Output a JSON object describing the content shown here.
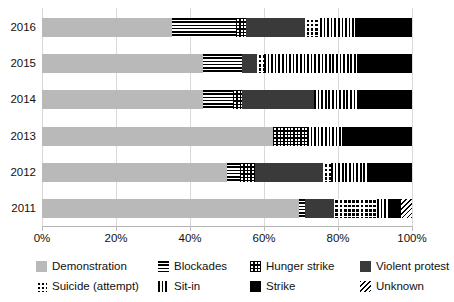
{
  "chart_data": {
    "type": "bar",
    "orientation": "horizontal",
    "stacked": true,
    "normalized": true,
    "title": "",
    "xlabel": "",
    "ylabel": "",
    "xlim": [
      0,
      100
    ],
    "xtick_labels": [
      "0%",
      "20%",
      "40%",
      "60%",
      "80%",
      "100%"
    ],
    "xticks": [
      0,
      20,
      40,
      60,
      80,
      100
    ],
    "grid": true,
    "legend_position": "bottom",
    "categories": [
      "2016",
      "2015",
      "2014",
      "2013",
      "2012",
      "2011"
    ],
    "series": [
      {
        "name": "Demonstration",
        "pattern": "solid-light-gray",
        "color": "#b9b9b9",
        "values": [
          35.0,
          43.5,
          43.5,
          62.5,
          50.0,
          69.5
        ]
      },
      {
        "name": "Blockades",
        "pattern": "horizontal-lines",
        "color": "#000000",
        "values": [
          17.5,
          10.5,
          8.0,
          0.0,
          3.5,
          1.5
        ]
      },
      {
        "name": "Hunger strike",
        "pattern": "cross-grid",
        "color": "#000000",
        "values": [
          2.5,
          0.0,
          2.5,
          9.0,
          4.0,
          0.0
        ]
      },
      {
        "name": "Violent protest",
        "pattern": "solid-dark-gray",
        "color": "#3a3a3a",
        "values": [
          16.0,
          4.0,
          19.5,
          0.0,
          18.5,
          8.0
        ]
      },
      {
        "name": "Suicide (attempt)",
        "pattern": "dotted-grid",
        "color": "#000000",
        "values": [
          4.0,
          2.0,
          0.0,
          0.0,
          2.0,
          11.5
        ]
      },
      {
        "name": "Sit-in",
        "pattern": "vertical-lines",
        "color": "#000000",
        "values": [
          9.5,
          25.0,
          12.0,
          9.5,
          10.5,
          3.0
        ]
      },
      {
        "name": "Strike",
        "pattern": "solid-black",
        "color": "#000000",
        "values": [
          15.5,
          15.0,
          14.5,
          19.0,
          11.5,
          3.5
        ]
      },
      {
        "name": "Unknown",
        "pattern": "diagonal-hatch",
        "color": "#000000",
        "values": [
          0.0,
          0.0,
          0.0,
          0.0,
          0.0,
          3.0
        ]
      }
    ]
  },
  "legend": {
    "items": [
      {
        "label": "Demonstration",
        "swatch": "solid-light-gray"
      },
      {
        "label": "Blockades",
        "swatch": "horizontal-lines"
      },
      {
        "label": "Hunger strike",
        "swatch": "cross-grid"
      },
      {
        "label": "Violent protest",
        "swatch": "solid-dark-gray"
      },
      {
        "label": "Suicide (attempt)",
        "swatch": "dotted-grid"
      },
      {
        "label": "Sit-in",
        "swatch": "vertical-lines"
      },
      {
        "label": "Strike",
        "swatch": "solid-black"
      },
      {
        "label": "Unknown",
        "swatch": "diagonal-hatch"
      }
    ]
  },
  "colors": {
    "demonstration": "#b9b9b9",
    "violent_protest": "#3a3a3a",
    "strike": "#000000",
    "gridline": "#d9d9d9",
    "text": "#111111"
  }
}
